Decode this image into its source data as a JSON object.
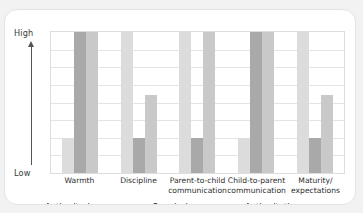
{
  "axis": {
    "high_label": "High",
    "low_label": "Low",
    "arrow_icon": "up-arrow-icon"
  },
  "legend": {
    "items": [
      {
        "label": "Authoritarian",
        "color": "#dcdcdc",
        "swatch_icon": "legend-swatch-icon"
      },
      {
        "label": "Permissive",
        "color": "#a9a9a9",
        "swatch_icon": "legend-swatch-icon"
      },
      {
        "label": "Authoritative",
        "color": "#c9c9c9",
        "swatch_icon": "legend-swatch-icon"
      }
    ]
  },
  "categories": [
    {
      "line1": "Warmth",
      "line2": ""
    },
    {
      "line1": "Discipline",
      "line2": ""
    },
    {
      "line1": "Parent-to-child",
      "line2": "communication"
    },
    {
      "line1": "Child-to-parent",
      "line2": "communication"
    },
    {
      "line1": "Maturity/",
      "line2": "expectations"
    }
  ],
  "chart_data": {
    "type": "bar",
    "title": "",
    "subtitle": "",
    "xlabel": "",
    "ylabel": "",
    "ylim": [
      0,
      100
    ],
    "ytick_labels": [
      "Low",
      "High"
    ],
    "grid": true,
    "gridlines": 8,
    "legend_position": "bottom",
    "categories": [
      "Warmth",
      "Discipline",
      "Parent-to-child communication",
      "Child-to-parent communication",
      "Maturity/expectations"
    ],
    "series": [
      {
        "name": "Authoritarian",
        "color": "#dcdcdc",
        "values": [
          25,
          100,
          100,
          25,
          100
        ]
      },
      {
        "name": "Permissive",
        "color": "#a9a9a9",
        "values": [
          100,
          25,
          25,
          100,
          25
        ]
      },
      {
        "name": "Authoritative",
        "color": "#c9c9c9",
        "values": [
          100,
          55,
          100,
          100,
          55
        ]
      }
    ]
  }
}
